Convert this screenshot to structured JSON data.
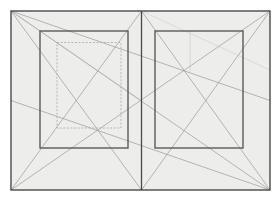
{
  "figure": {
    "type": "page-construction-canon",
    "caption": "",
    "width": 280,
    "height": 205,
    "background_color": "#ffffff"
  },
  "colors": {
    "page_fill": "#ededeb",
    "outer_border": "#4a4a4a",
    "spine_line": "#4a4a4a",
    "text_block_border": "#5a5a5a",
    "construction_line": "#9a9a9a",
    "dashed_block": "#a8a8a8",
    "faint_guide": "#c8c8c8"
  },
  "spread": {
    "outer_frame": {
      "x": 11,
      "y": 11,
      "width": 259,
      "height": 179
    },
    "spine_x": 141.5,
    "left_page": {
      "name": "verso",
      "page_rect": {
        "x": 11,
        "y": 11,
        "width": 130.5,
        "height": 179
      },
      "text_block": {
        "x": 40,
        "y": 31,
        "width": 88,
        "height": 117
      },
      "alternate_text_block_dashed": {
        "x": 57,
        "y": 42.5,
        "width": 64,
        "height": 85.5
      },
      "diagonals": [
        {
          "name": "page-diagonal-tl-br",
          "x1": 11,
          "y1": 11,
          "x2": 141.5,
          "y2": 190
        },
        {
          "name": "page-diagonal-bl-tr",
          "x1": 11,
          "y1": 190,
          "x2": 141.5,
          "y2": 11
        },
        {
          "name": "spread-diagonal-from-left-bottom",
          "x1": 11,
          "y1": 190,
          "x2": 270,
          "y2": 11
        },
        {
          "name": "half-diagonal-upper",
          "x1": 11,
          "y1": 11,
          "x2": 270,
          "y2": 100.5
        }
      ]
    },
    "right_page": {
      "name": "recto",
      "page_rect": {
        "x": 141.5,
        "y": 11,
        "width": 128.5,
        "height": 179
      },
      "text_block": {
        "x": 155,
        "y": 31,
        "width": 88,
        "height": 117
      },
      "alternate_text_block_dashed": null,
      "vertical_guide_x": 190,
      "diagonals": [
        {
          "name": "page-diagonal-tl-br",
          "x1": 141.5,
          "y1": 11,
          "x2": 270,
          "y2": 190
        },
        {
          "name": "page-diagonal-bl-tr",
          "x1": 141.5,
          "y1": 190,
          "x2": 270,
          "y2": 11
        },
        {
          "name": "spread-diagonal-to-right-bottom",
          "x1": 11,
          "y1": 11,
          "x2": 270,
          "y2": 190
        },
        {
          "name": "half-diagonal-lower",
          "x1": 11,
          "y1": 100.5,
          "x2": 270,
          "y2": 190
        }
      ]
    }
  },
  "annotations": {
    "intersection_left": {
      "x": 97,
      "y": 80
    },
    "intersection_right": {
      "x": 190,
      "y": 72
    },
    "intersection_center": {
      "x": 141.5,
      "y": 100.5
    }
  },
  "legend": {
    "solid_line_label": "Text block",
    "dashed_line_label": "Alternate text block",
    "thin_line_label": "Construction diagonal"
  }
}
